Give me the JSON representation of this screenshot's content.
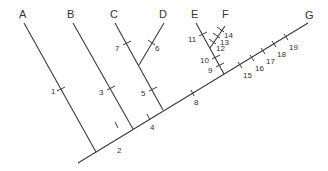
{
  "diagram": {
    "type": "cladogram",
    "taxa": [
      {
        "label": "A",
        "x": 23,
        "y": 17
      },
      {
        "label": "B",
        "x": 71,
        "y": 17
      },
      {
        "label": "C",
        "x": 114,
        "y": 17
      },
      {
        "label": "D",
        "x": 163,
        "y": 17
      },
      {
        "label": "E",
        "x": 195,
        "y": 17
      },
      {
        "label": "F",
        "x": 226,
        "y": 17
      },
      {
        "label": "G",
        "x": 309,
        "y": 18
      }
    ],
    "characters": [
      {
        "label": "1",
        "x": 55,
        "y": 93
      },
      {
        "label": "2",
        "x": 117,
        "y": 152
      },
      {
        "label": "3",
        "x": 101,
        "y": 94
      },
      {
        "label": "4",
        "x": 149,
        "y": 129
      },
      {
        "label": "5",
        "x": 143,
        "y": 95
      },
      {
        "label": "6",
        "x": 155,
        "y": 49
      },
      {
        "label": "7",
        "x": 117,
        "y": 49
      },
      {
        "label": "8",
        "x": 194,
        "y": 104
      },
      {
        "label": "9",
        "x": 209,
        "y": 71
      },
      {
        "label": "10",
        "x": 200,
        "y": 61
      },
      {
        "label": "11",
        "x": 189,
        "y": 41
      },
      {
        "label": "12",
        "x": 216,
        "y": 50
      },
      {
        "label": "13",
        "x": 220,
        "y": 44
      },
      {
        "label": "14",
        "x": 224,
        "y": 37
      },
      {
        "label": "15",
        "x": 243,
        "y": 77
      },
      {
        "label": "16",
        "x": 255,
        "y": 70
      },
      {
        "label": "17",
        "x": 266,
        "y": 63
      },
      {
        "label": "18",
        "x": 277,
        "y": 56
      },
      {
        "label": "19",
        "x": 289,
        "y": 49
      }
    ]
  }
}
